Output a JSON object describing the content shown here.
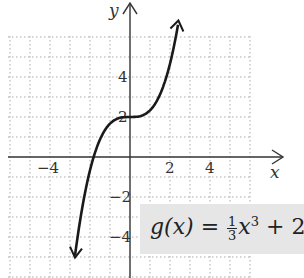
{
  "chart_data": {
    "type": "line",
    "title": "",
    "function_label": {
      "prefix": "g(x) = ",
      "frac_num": "1",
      "frac_den": "3",
      "var": "x",
      "exp": "3",
      "suffix": " + 2"
    },
    "xlabel": "x",
    "ylabel": "y",
    "x_ticks": [
      {
        "value": -4,
        "label": "−4"
      },
      {
        "value": 2,
        "label": "2"
      },
      {
        "value": 4,
        "label": "4"
      }
    ],
    "y_ticks": [
      {
        "value": 4,
        "label": "4"
      },
      {
        "value": 2,
        "label": "2"
      },
      {
        "value": -2,
        "label": "−2"
      },
      {
        "value": -4,
        "label": "−4"
      }
    ],
    "xlim": [
      -6,
      6
    ],
    "ylim": [
      -5.5,
      6
    ],
    "grid": true,
    "series": [
      {
        "name": "g(x) = (1/3)x^3 + 2",
        "x": [
          -2.6,
          -2,
          -1.5,
          -1,
          -0.5,
          0,
          0.5,
          1,
          1.5,
          2,
          2.4
        ],
        "y": [
          -3.86,
          -0.67,
          0.88,
          1.67,
          1.96,
          2,
          2.04,
          2.33,
          3.13,
          4.67,
          6.61
        ]
      }
    ]
  }
}
